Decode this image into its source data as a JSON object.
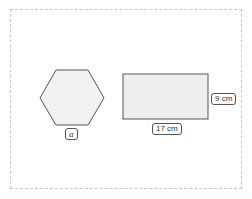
{
  "diagram": {
    "shapes": [
      {
        "type": "hexagon",
        "side_label": "a"
      },
      {
        "type": "rectangle",
        "width_label": "17 cm",
        "height_label": "9 cm"
      }
    ],
    "colors": {
      "stroke": "#555555",
      "fill": "#f2f2f2",
      "frame": "#c8c8c8"
    }
  }
}
